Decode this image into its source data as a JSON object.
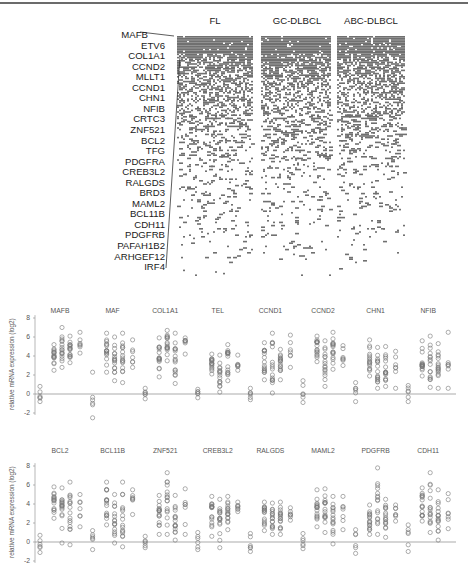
{
  "heatmap": {
    "groups": [
      {
        "label": "FL",
        "x0": 177,
        "x1": 253
      },
      {
        "label": "GC-DLBCL",
        "x0": 261,
        "x1": 331
      },
      {
        "label": "ABC-DLBCL",
        "x0": 337,
        "x1": 404
      }
    ],
    "top": 36,
    "bottom": 282,
    "cell_color": "#707070",
    "genes": [
      "MAFB",
      "ETV6",
      "COL1A1",
      "CCND2",
      "MLLT1",
      "CCND1",
      "CHN1",
      "NFIB",
      "CRTC3",
      "ZNF521",
      "BCL2",
      "TFG",
      "PDGFRA",
      "CREB3L2",
      "RALGDS",
      "BRD3",
      "MAML2",
      "BCL11B",
      "CDH11",
      "PDGFRB",
      "PAFAH1B2",
      "ARHGEF12",
      "IRF4"
    ]
  },
  "panels": [
    {
      "ylabel": "relative mRNA expression (log2)",
      "ticks": [
        "8",
        "6",
        "4",
        "2",
        "0",
        "-2"
      ],
      "genes": [
        "MAFB",
        "MAF",
        "COL1A1",
        "TEL",
        "CCND1",
        "CCND2",
        "CHN1",
        "NFIB"
      ]
    },
    {
      "ylabel": "relative mRNA expression (log2)",
      "ticks": [
        "8",
        "6",
        "4",
        "2",
        "0",
        "-2"
      ],
      "genes": [
        "BCL2",
        "BCL11B",
        "ZNF521",
        "CREB3L2",
        "RALGDS",
        "MAML2",
        "PDGFRB",
        "CDH11"
      ]
    }
  ],
  "chart_data": [
    {
      "type": "heatmap",
      "title": "",
      "column_groups": [
        "FL",
        "GC-DLBCL",
        "ABC-DLBCL"
      ],
      "row_labels": [
        "MAFB",
        "ETV6",
        "COL1A1",
        "CCND2",
        "MLLT1",
        "CCND1",
        "CHN1",
        "NFIB",
        "CRTC3",
        "ZNF521",
        "BCL2",
        "TFG",
        "PDGFRA",
        "CREB3L2",
        "RALGDS",
        "BRD3",
        "MAML2",
        "BCL11B",
        "CDH11",
        "PDGFRB",
        "PAFAH1B2",
        "ARHGEF12",
        "IRF4"
      ],
      "notes": "Binary presence heatmap (dark gray = present); densest at top rows, increasingly sparse toward bottom rows across all three groups",
      "legend": []
    },
    {
      "type": "scatter",
      "title": "",
      "xlabel": "",
      "ylabel": "relative mRNA expression (log2)",
      "ylim": [
        -2,
        8
      ],
      "yticks": [
        -2,
        0,
        2,
        4,
        6,
        8
      ],
      "reference_line_y": 0,
      "categories": [
        "MAFB",
        "MAF",
        "COL1A1",
        "TEL",
        "CCND1",
        "CCND2",
        "CHN1",
        "NFIB"
      ],
      "series_per_category": [
        "normal",
        "sample group 1",
        "sample group 2",
        "sample group 3",
        "sample group 4"
      ],
      "approx_ranges": {
        "MAFB": [
          [
            -0.8,
            0.8
          ],
          [
            2.5,
            5.2
          ],
          [
            2.8,
            7.0
          ],
          [
            3.3,
            6.1
          ],
          [
            4.3,
            6.5
          ]
        ],
        "MAF": [
          [
            -2.5,
            2.3
          ],
          [
            2.3,
            6.4
          ],
          [
            1.4,
            6.0
          ],
          [
            1.2,
            6.4
          ],
          [
            2.8,
            5.7
          ]
        ],
        "COL1A1": [
          [
            -0.5,
            0.6
          ],
          [
            1.8,
            5.9
          ],
          [
            3.5,
            6.7
          ],
          [
            1.1,
            6.4
          ],
          [
            4.2,
            5.9
          ]
        ],
        "TEL": [
          [
            -0.4,
            0.5
          ],
          [
            2.1,
            4.2
          ],
          [
            0.2,
            4.1
          ],
          [
            1.4,
            5.2
          ],
          [
            2.5,
            4.1
          ]
        ],
        "CCND1": [
          [
            -0.6,
            0.6
          ],
          [
            1.5,
            5.4
          ],
          [
            0.1,
            6.4
          ],
          [
            1.5,
            4.7
          ],
          [
            2.8,
            6.2
          ]
        ],
        "CCND2": [
          [
            -0.9,
            1.4
          ],
          [
            3.4,
            6.1
          ],
          [
            0.8,
            5.6
          ],
          [
            2.6,
            6.5
          ],
          [
            3.0,
            5.1
          ]
        ],
        "CHN1": [
          [
            -0.8,
            1.2
          ],
          [
            1.9,
            5.7
          ],
          [
            0.6,
            4.9
          ],
          [
            0.8,
            5.0
          ],
          [
            0.6,
            4.5
          ]
        ],
        "NFIB": [
          [
            -0.8,
            0.9
          ],
          [
            1.9,
            5.6
          ],
          [
            0.7,
            6.1
          ],
          [
            0.6,
            5.3
          ],
          [
            0.6,
            6.5
          ]
        ]
      }
    },
    {
      "type": "scatter",
      "title": "",
      "xlabel": "",
      "ylabel": "relative mRNA expression (log2)",
      "ylim": [
        -2,
        8
      ],
      "yticks": [
        -2,
        0,
        2,
        4,
        6,
        8
      ],
      "reference_line_y": 0,
      "categories": [
        "BCL2",
        "BCL11B",
        "ZNF521",
        "CREB3L2",
        "RALGDS",
        "MAML2",
        "PDGFRB",
        "CDH11"
      ],
      "series_per_category": [
        "normal",
        "sample group 1",
        "sample group 2",
        "sample group 3",
        "sample group 4"
      ],
      "approx_ranges": {
        "BCL2": [
          [
            -1.1,
            0.7
          ],
          [
            2.5,
            5.8
          ],
          [
            -0.1,
            5.7
          ],
          [
            -0.3,
            6.3
          ],
          [
            1.6,
            5.0
          ]
        ],
        "BCL11B": [
          [
            -0.8,
            1.2
          ],
          [
            1.8,
            6.3
          ],
          [
            -0.1,
            5.0
          ],
          [
            -0.5,
            6.3
          ],
          [
            2.9,
            5.5
          ]
        ],
        "ZNF521": [
          [
            -0.6,
            0.6
          ],
          [
            0.8,
            4.9
          ],
          [
            0.8,
            7.3
          ],
          [
            0.2,
            4.9
          ],
          [
            0.8,
            5.6
          ]
        ],
        "CREB3L2": [
          [
            -0.8,
            1.0
          ],
          [
            0.6,
            4.8
          ],
          [
            -0.6,
            4.5
          ],
          [
            1.3,
            4.8
          ],
          [
            3.2,
            4.2
          ]
        ],
        "RALGDS": [
          [
            -1.0,
            0.9
          ],
          [
            1.2,
            4.2
          ],
          [
            0.8,
            4.1
          ],
          [
            0.8,
            4.2
          ],
          [
            2.3,
            3.6
          ]
        ],
        "MAML2": [
          [
            -0.7,
            0.9
          ],
          [
            1.6,
            5.5
          ],
          [
            1.0,
            5.6
          ],
          [
            -0.2,
            4.8
          ],
          [
            1.3,
            4.8
          ]
        ],
        "PDGFRB": [
          [
            -1.2,
            1.3
          ],
          [
            0.8,
            3.9
          ],
          [
            0.8,
            7.8
          ],
          [
            0.5,
            4.5
          ],
          [
            2.2,
            3.9
          ]
        ],
        "CDH11": [
          [
            -1.0,
            1.8
          ],
          [
            2.2,
            5.7
          ],
          [
            1.0,
            7.3
          ],
          [
            0.2,
            5.5
          ],
          [
            1.4,
            5.1
          ]
        ]
      }
    }
  ]
}
